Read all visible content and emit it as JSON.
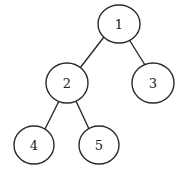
{
  "diagram": {
    "type": "binary-tree",
    "colors": {
      "stroke": "#2a2a2a",
      "text": "#222222",
      "fill": "#ffffff",
      "background": "#ffffff"
    },
    "nodes": [
      {
        "id": "1",
        "label": "1",
        "cx": 119,
        "cy": 24,
        "rx": 21,
        "ry": 19
      },
      {
        "id": "2",
        "label": "2",
        "cx": 67,
        "cy": 83,
        "rx": 21,
        "ry": 20
      },
      {
        "id": "3",
        "label": "3",
        "cx": 153,
        "cy": 83,
        "rx": 21,
        "ry": 20
      },
      {
        "id": "4",
        "label": "4",
        "cx": 34,
        "cy": 145,
        "rx": 20,
        "ry": 19
      },
      {
        "id": "5",
        "label": "5",
        "cx": 99,
        "cy": 145,
        "rx": 20,
        "ry": 19
      }
    ],
    "edges": [
      {
        "from": "1",
        "to": "2",
        "x1": 104,
        "y1": 37,
        "x2": 80,
        "y2": 68
      },
      {
        "from": "1",
        "to": "3",
        "x1": 130,
        "y1": 41,
        "x2": 145,
        "y2": 65
      },
      {
        "from": "2",
        "to": "4",
        "x1": 59,
        "y1": 101,
        "x2": 45,
        "y2": 129
      },
      {
        "from": "2",
        "to": "5",
        "x1": 76,
        "y1": 101,
        "x2": 89,
        "y2": 129
      }
    ]
  }
}
